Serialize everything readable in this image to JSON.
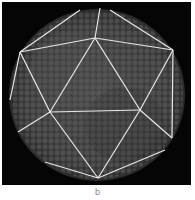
{
  "figure": {
    "panel_label": "b",
    "colors": {
      "background": "#050505",
      "particle": "#5a5a5a",
      "lattice": "#e8e8e8",
      "page": "#ffffff",
      "label": "#888888"
    }
  }
}
